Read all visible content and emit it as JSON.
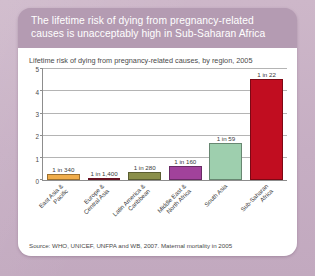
{
  "card": {
    "title": "The lifetime risk of dying from pregnancy-related causes is unacceptably high in Sub-Saharan Africa",
    "source": "Source: WHO, UNICEF, UNFPA and WB, 2007. Maternal mortality in 2005"
  },
  "chart_data": {
    "type": "bar",
    "title": "Lifetime risk of dying from pregnancy-related causes, by region, 2005",
    "xlabel": "",
    "ylabel": "",
    "ylim": [
      0,
      5
    ],
    "yticks": [
      "0",
      "1",
      "2",
      "3",
      "4",
      "5"
    ],
    "grid": true,
    "legend": "none",
    "categories": [
      "East Asia & Pacific",
      "Europe & Central Asia",
      "Latin America & Caribbean",
      "Middle East & North Africa",
      "South Asia",
      "Sub-Saharan Africa"
    ],
    "category_lines": [
      [
        "East Asia &",
        "Pacific"
      ],
      [
        "Europe &",
        "Central Asia"
      ],
      [
        "Latin America &",
        "Caribbean"
      ],
      [
        "Middle East &",
        "North Africa"
      ],
      [
        "South Asia"
      ],
      [
        "Sub-Saharan",
        "Africa"
      ]
    ],
    "values": [
      0.29,
      0.07,
      0.36,
      0.63,
      1.69,
      4.55
    ],
    "data_labels": [
      "1 in 340",
      "1 in 1,400",
      "1 in 280",
      "1 in 160",
      "1 in 59",
      "1 in 22"
    ],
    "colors": [
      "#f0ad4b",
      "#9e1b34",
      "#8a8f4a",
      "#a1429b",
      "#9ecfae",
      "#c10d20"
    ]
  }
}
